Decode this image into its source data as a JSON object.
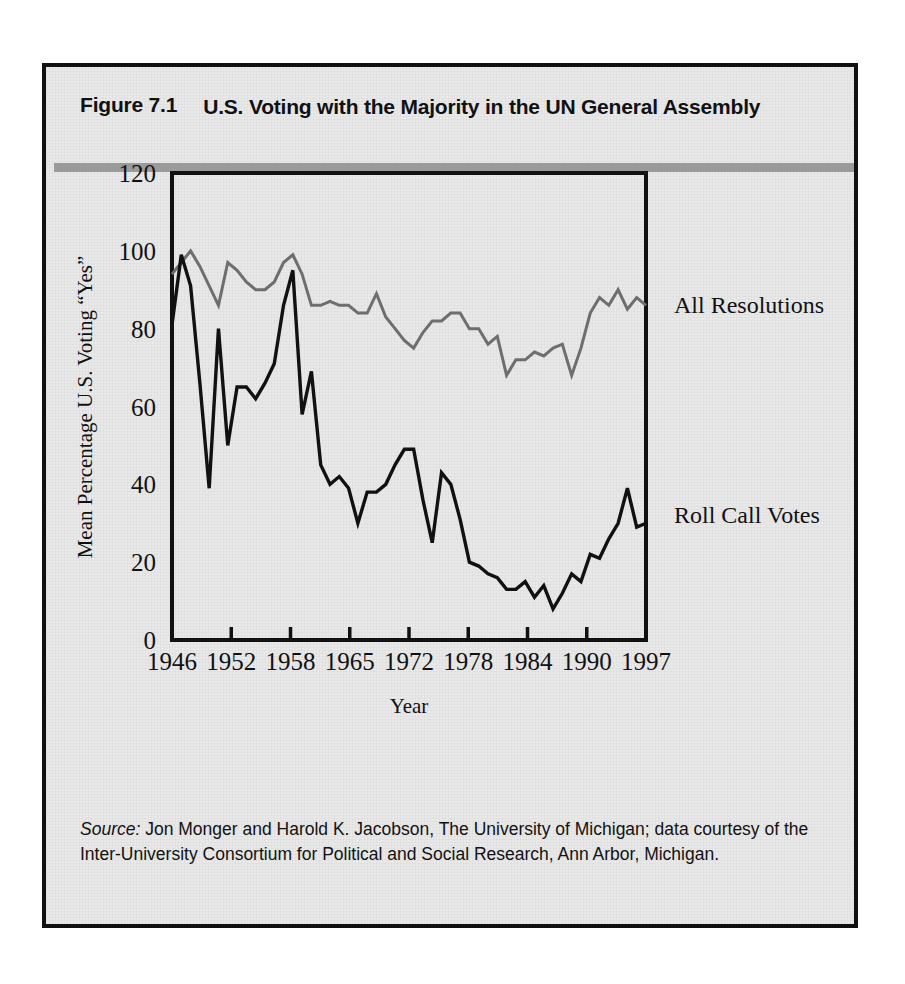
{
  "figure": {
    "number": "Figure 7.1",
    "title": "U.S. Voting with the Majority in the UN General Assembly",
    "source_label": "Source:",
    "source_text": " Jon Monger and Harold K. Jacobson, The University of Michigan; data courtesy of the Inter-University Consortium for Political and Social Research, Ann Arbor, Michigan.",
    "border_color": "#111111",
    "background_color": "#e9e9e9",
    "rule_color": "#9a9a9a"
  },
  "chart_data": {
    "type": "line",
    "title": "U.S. Voting with the Majority in the UN General Assembly",
    "xlabel": "Year",
    "ylabel": "Mean Percentage U.S. Voting “Yes”",
    "xlim": [
      1946,
      1997
    ],
    "ylim": [
      0,
      120
    ],
    "ytick_labels": [
      "0",
      "20",
      "40",
      "60",
      "80",
      "100",
      "120"
    ],
    "yticks": [
      0,
      20,
      40,
      60,
      80,
      100,
      120
    ],
    "xtick_labels": [
      "1946",
      "1952",
      "1958",
      "1965",
      "1972",
      "1978",
      "1984",
      "1990",
      "1997"
    ],
    "xticks": [
      1946,
      1952,
      1958,
      1965,
      1972,
      1978,
      1984,
      1990,
      1997
    ],
    "grid": false,
    "legend_position": "right-of-plot (inline labels)",
    "x": [
      1946,
      1947,
      1948,
      1949,
      1950,
      1951,
      1952,
      1953,
      1954,
      1955,
      1956,
      1957,
      1958,
      1959,
      1960,
      1961,
      1962,
      1963,
      1964,
      1965,
      1966,
      1967,
      1968,
      1969,
      1970,
      1971,
      1972,
      1973,
      1974,
      1975,
      1976,
      1977,
      1978,
      1979,
      1980,
      1981,
      1982,
      1983,
      1984,
      1985,
      1986,
      1987,
      1988,
      1989,
      1990,
      1991,
      1992,
      1993,
      1994,
      1995,
      1996,
      1997
    ],
    "series": [
      {
        "name": "All Resolutions",
        "color": "#6e6e6e",
        "label_text": "All Resolutions",
        "values": [
          94,
          97,
          100,
          96,
          91,
          86,
          97,
          95,
          92,
          90,
          90,
          92,
          97,
          99,
          94,
          86,
          86,
          87,
          86,
          86,
          84,
          84,
          89,
          83,
          80,
          77,
          75,
          79,
          82,
          82,
          84,
          84,
          80,
          80,
          76,
          78,
          68,
          72,
          72,
          74,
          73,
          75,
          76,
          68,
          75,
          84,
          88,
          86,
          90,
          85,
          88,
          86
        ]
      },
      {
        "name": "Roll Call Votes",
        "color": "#111111",
        "label_text": "Roll Call Votes",
        "values": [
          81,
          99,
          91,
          66,
          39,
          80,
          50,
          65,
          65,
          62,
          66,
          71,
          86,
          95,
          58,
          69,
          45,
          40,
          42,
          39,
          30,
          38,
          38,
          40,
          45,
          49,
          49,
          36,
          25,
          43,
          40,
          31,
          20,
          19,
          17,
          16,
          13,
          13,
          15,
          11,
          14,
          8,
          12,
          17,
          15,
          22,
          21,
          26,
          30,
          39,
          29,
          30
        ]
      }
    ],
    "annotations": [
      {
        "text": "All Resolutions",
        "x": 1998,
        "y": 86
      },
      {
        "text": "Roll Call Votes",
        "x": 1998,
        "y": 32
      }
    ]
  }
}
